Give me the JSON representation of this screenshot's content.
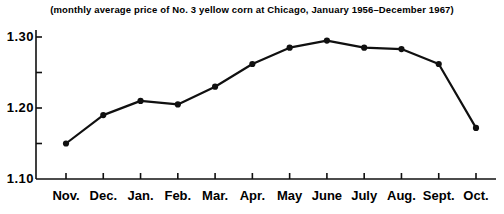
{
  "chart_data": {
    "type": "line",
    "title": "(monthly average price of No. 3 yellow corn at Chicago, January 1956–December 1967)",
    "xlabel": "",
    "ylabel": "",
    "categories": [
      "Nov.",
      "Dec.",
      "Jan.",
      "Feb.",
      "Mar.",
      "Apr.",
      "May",
      "June",
      "July",
      "Aug.",
      "Sept.",
      "Oct."
    ],
    "values": [
      1.15,
      1.19,
      1.21,
      1.205,
      1.23,
      1.262,
      1.285,
      1.295,
      1.285,
      1.283,
      1.262,
      1.172
    ],
    "ylim": [
      1.1,
      1.32
    ],
    "ytick_major": [
      "1.30",
      "1.20",
      "1.10"
    ],
    "ytick_major_values": [
      1.3,
      1.2,
      1.1
    ],
    "ytick_minor_values": [
      1.25,
      1.15
    ],
    "grid": false,
    "legend": null,
    "marker": "filled-circle",
    "line_color": "#101010",
    "marker_color": "#101010",
    "axis_color": "#101010",
    "background": "#ffffff"
  }
}
